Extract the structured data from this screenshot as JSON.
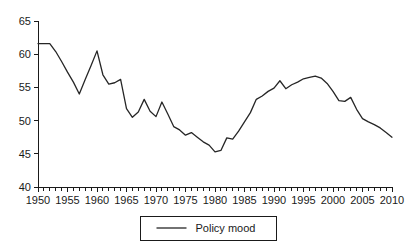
{
  "chart_data": {
    "type": "line",
    "title": "",
    "xlabel": "",
    "ylabel": "",
    "xlim": [
      1950,
      2010
    ],
    "ylim": [
      40,
      65
    ],
    "grid": false,
    "legend_position": "bottom-center",
    "x_tick_labels": [
      "1950",
      "1955",
      "1960",
      "1965",
      "1970",
      "1975",
      "1980",
      "1985",
      "1990",
      "1995",
      "2000",
      "2005",
      "2010"
    ],
    "x_tick_values": [
      1950,
      1955,
      1960,
      1965,
      1970,
      1975,
      1980,
      1985,
      1990,
      1995,
      2000,
      2005,
      2010
    ],
    "x_minor_tick_step": 1,
    "y_tick_labels": [
      "40",
      "45",
      "50",
      "55",
      "60",
      "65"
    ],
    "y_tick_values": [
      40,
      45,
      50,
      55,
      60,
      65
    ],
    "series": [
      {
        "name": "Policy mood",
        "color": "#262626",
        "x": [
          1950,
          1951,
          1952,
          1953,
          1954,
          1955,
          1956,
          1957,
          1958,
          1959,
          1960,
          1961,
          1962,
          1963,
          1964,
          1965,
          1966,
          1967,
          1968,
          1969,
          1970,
          1971,
          1972,
          1973,
          1974,
          1975,
          1976,
          1977,
          1978,
          1979,
          1980,
          1981,
          1982,
          1983,
          1984,
          1985,
          1986,
          1987,
          1988,
          1989,
          1990,
          1991,
          1992,
          1993,
          1994,
          1995,
          1996,
          1997,
          1998,
          1999,
          2000,
          2001,
          2002,
          2003,
          2004,
          2005,
          2006,
          2007,
          2008,
          2009,
          2010
        ],
        "y": [
          61.6,
          61.6,
          61.6,
          60.4,
          58.9,
          57.3,
          55.8,
          54.0,
          56.2,
          58.3,
          60.5,
          56.9,
          55.5,
          55.7,
          56.2,
          51.8,
          50.5,
          51.3,
          53.2,
          51.4,
          50.6,
          52.8,
          51.0,
          49.1,
          48.6,
          47.8,
          48.2,
          47.5,
          46.8,
          46.3,
          45.3,
          45.5,
          47.4,
          47.2,
          48.4,
          49.8,
          51.2,
          53.2,
          53.7,
          54.4,
          54.9,
          56.0,
          54.8,
          55.4,
          55.8,
          56.3,
          56.5,
          56.7,
          56.4,
          55.6,
          54.4,
          53.0,
          52.9,
          53.5,
          51.7,
          50.3,
          49.8,
          49.4,
          48.9,
          48.2,
          47.5
        ]
      }
    ]
  },
  "legend": {
    "entries": [
      {
        "label": "Policy mood"
      }
    ]
  }
}
